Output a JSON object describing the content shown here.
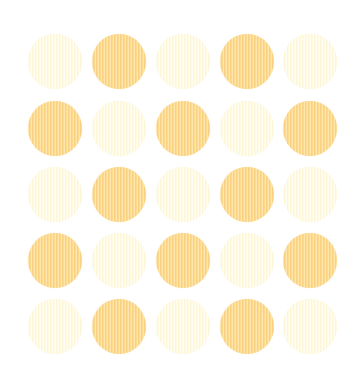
{
  "image": {
    "description": "Polka-dot pattern: 5x5 grid of circles alternating light cream and pale orange in a checkerboard, with a fine vertical striped texture on a white background",
    "background_color": "#ffffff",
    "colors": {
      "orange": "#fcd98c",
      "cream": "#fffbe3"
    },
    "grid": {
      "rows": 5,
      "cols": 5,
      "col_centers_x": [
        55,
        119,
        183,
        247,
        310
      ],
      "row_centers_y": [
        61,
        128,
        194,
        260,
        326
      ],
      "dot_diameter": 54
    },
    "dots": [
      [
        "cream",
        "orange",
        "cream",
        "orange",
        "cream"
      ],
      [
        "orange",
        "cream",
        "orange",
        "cream",
        "orange"
      ],
      [
        "cream",
        "orange",
        "cream",
        "orange",
        "cream"
      ],
      [
        "orange",
        "cream",
        "orange",
        "cream",
        "orange"
      ],
      [
        "cream",
        "orange",
        "cream",
        "orange",
        "cream"
      ]
    ]
  }
}
